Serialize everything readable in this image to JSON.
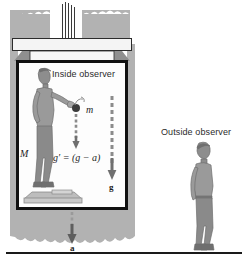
{
  "figure": {
    "type": "physics-diagram",
    "labels": {
      "inside_observer": "Inside observer",
      "outside_observer": "Outside observer",
      "mass_person": "M",
      "mass_ball": "m",
      "equation": "g′ = (g − a)",
      "gravity_vector": "g",
      "acceleration_vector": "a"
    },
    "colors": {
      "shaft_wall": "#b2b2b2",
      "car_border": "#111111",
      "car_fill": "#fdfdfd",
      "arrow": "#6f6f6f",
      "ball": "#3b3b3b",
      "ground_line": "#1a1a1a",
      "figure_ink": "#7a7a7a",
      "text": "#2b2b2b"
    },
    "elements": {
      "cable_count": 5,
      "elevator_car": "white box with thick black border inside gray shaft",
      "scale_platform": "platform under inside observer's feet",
      "ball_arrow": "short dashed downward arrow under ball",
      "g_arrow": "long dashed downward arrow labeled g",
      "a_arrow": "downward arrow below car labeled a"
    }
  }
}
